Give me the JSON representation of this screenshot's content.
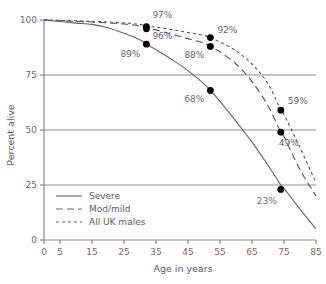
{
  "chart_data": {
    "type": "line",
    "title": "",
    "subtitle": "",
    "xlabel": "Age in years",
    "ylabel": "Percent alive",
    "xlim": [
      0,
      85
    ],
    "ylim": [
      0,
      100
    ],
    "xticks": [
      "0",
      "5",
      "15",
      "25",
      "35",
      "45",
      "55",
      "65",
      "75",
      "85"
    ],
    "xtick_values": [
      0,
      5,
      15,
      25,
      35,
      45,
      55,
      65,
      75,
      85
    ],
    "yticks": [
      "0",
      "25",
      "50",
      "75",
      "100"
    ],
    "ytick_values": [
      0,
      25,
      50,
      75,
      100
    ],
    "grid": "horizontal",
    "gridlines_at": [
      25,
      50,
      75
    ],
    "legend_position": "bottom-left",
    "series": [
      {
        "name": "Severe",
        "style": "solid",
        "color": "#666666",
        "x": [
          0,
          5,
          10,
          15,
          20,
          25,
          30,
          32,
          35,
          40,
          45,
          50,
          52,
          55,
          60,
          65,
          70,
          74,
          75,
          80,
          85
        ],
        "values": [
          100,
          99.3,
          98.6,
          98.0,
          96.5,
          94.0,
          91.0,
          89,
          86.5,
          82.0,
          77.0,
          71.0,
          68,
          63.0,
          54.0,
          44.5,
          34.0,
          25,
          23.5,
          14.0,
          5.0
        ]
      },
      {
        "name": "Mod/mild",
        "style": "dashed",
        "color": "#555555",
        "x": [
          0,
          5,
          10,
          15,
          20,
          25,
          30,
          32,
          35,
          40,
          45,
          50,
          52,
          55,
          60,
          65,
          70,
          74,
          75,
          80,
          85
        ],
        "values": [
          100,
          99.7,
          99.4,
          99.1,
          98.7,
          98.2,
          97.3,
          96,
          95.5,
          93.5,
          91.5,
          89.5,
          88,
          85.5,
          80.0,
          72.0,
          61.0,
          49,
          47.0,
          32.0,
          20.0
        ]
      },
      {
        "name": "All UK males",
        "style": "dotted",
        "color": "#555555",
        "x": [
          0,
          5,
          10,
          15,
          20,
          25,
          30,
          32,
          35,
          40,
          45,
          50,
          52,
          55,
          60,
          65,
          70,
          74,
          75,
          80,
          85
        ],
        "values": [
          100,
          99.8,
          99.6,
          99.4,
          99.1,
          98.7,
          98.0,
          97,
          96.8,
          95.6,
          94.3,
          93.0,
          92,
          90.0,
          86.0,
          80.0,
          71.0,
          59,
          57.0,
          42.0,
          26.0
        ]
      }
    ],
    "markers": [
      {
        "series": "All UK males",
        "x": 32,
        "y": 97,
        "label": "97%",
        "label_dx": 6,
        "label_dy": -9
      },
      {
        "series": "Mod/mild",
        "x": 32,
        "y": 96,
        "label": "96%",
        "label_dx": 6,
        "label_dy": 10
      },
      {
        "series": "Severe",
        "x": 32,
        "y": 89,
        "label": "89%",
        "label_dx": -26,
        "label_dy": 13
      },
      {
        "series": "All UK males",
        "x": 52,
        "y": 92,
        "label": "92%",
        "label_dx": 7,
        "label_dy": -5
      },
      {
        "series": "Mod/mild",
        "x": 52,
        "y": 88,
        "label": "88%",
        "label_dx": -26,
        "label_dy": 12
      },
      {
        "series": "Severe",
        "x": 52,
        "y": 68,
        "label": "68%",
        "label_dx": -26,
        "label_dy": 12
      },
      {
        "series": "All UK males",
        "x": 74,
        "y": 59,
        "label": "59%",
        "label_dx": 7,
        "label_dy": -6
      },
      {
        "series": "Mod/mild",
        "x": 74,
        "y": 49,
        "label": "49%",
        "label_dx": -2,
        "label_dy": 14
      },
      {
        "series": "Severe",
        "x": 74,
        "y": 23,
        "label": "23%",
        "label_dx": -24,
        "label_dy": 15
      }
    ]
  },
  "legend": {
    "items": [
      {
        "label": "Severe",
        "style": "solid"
      },
      {
        "label": "Mod/mild",
        "style": "dashed"
      },
      {
        "label": "All UK males",
        "style": "dotted"
      }
    ]
  },
  "colors": {
    "axis": "#8c8c8c",
    "grid": "#8c8c8c",
    "tick_text": "#6e6e6e",
    "label_text": "#6a6a6a",
    "marker": "#000000",
    "background": "#ffffff"
  }
}
